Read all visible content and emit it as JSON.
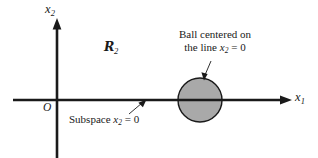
{
  "figure": {
    "type": "math-diagram",
    "background_color": "#ffffff",
    "ink_color": "#1a1a1a",
    "width": 318,
    "height": 158
  },
  "axes": {
    "horizontal": {
      "name": "x1-axis",
      "label": "x",
      "label_subscript": "1",
      "y": 100,
      "x_start": 13,
      "x_end": 292,
      "arrow": "right",
      "stroke_width": 2.6
    },
    "vertical": {
      "name": "x2-axis",
      "label": "x",
      "label_subscript": "2",
      "x": 57,
      "y_start": 20,
      "y_end": 158,
      "arrow": "up",
      "stroke_width": 2.6
    },
    "origin": {
      "label": "O",
      "x": 57,
      "y": 100
    }
  },
  "space_label": {
    "symbol": "R",
    "subscript": "2",
    "reads_as": "R2",
    "x": 108,
    "y": 48
  },
  "ball": {
    "name": "shaded-ball",
    "center_x": 200,
    "center_y": 100,
    "radius": 22,
    "fill_color": "#a9a9a9",
    "stroke_color": "#1a1a1a",
    "stroke_width": 1.4
  },
  "annotations": [
    {
      "name": "ball-caption",
      "lines": [
        "Ball centered on",
        "the line x",
        "= 0"
      ],
      "line1": "Ball centered on",
      "line2_prefix": "the line ",
      "line2_var": "x",
      "line2_sub": "2",
      "line2_suffix": " = 0",
      "leader": {
        "from_x": 210,
        "from_y": 62,
        "to_x": 204,
        "to_y": 79,
        "arrow": "end"
      }
    },
    {
      "name": "subspace-caption",
      "prefix": "Subspace ",
      "var": "x",
      "sub": "2",
      "suffix": " = 0",
      "leader": {
        "from_x": 131,
        "from_y": 113,
        "to_x": 145,
        "to_y": 101,
        "arrow": "end"
      }
    }
  ],
  "colors": {
    "background": "#ffffff",
    "ink": "#1a1a1a",
    "ball_fill": "#a9a9a9",
    "leader": "#1a1a1a"
  }
}
